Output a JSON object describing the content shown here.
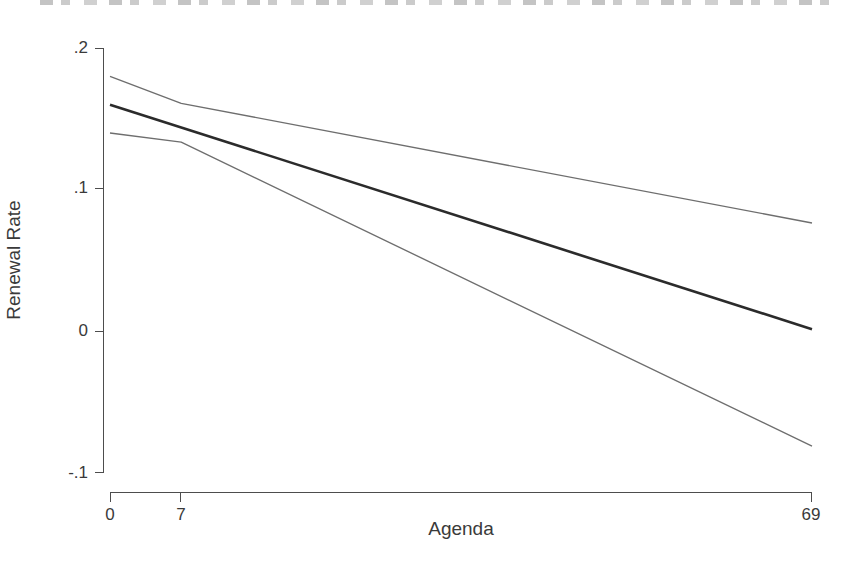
{
  "chart_data": {
    "type": "line",
    "title": "",
    "xlabel": "Agenda",
    "ylabel": "Renewal Rate",
    "xlim": [
      0,
      69
    ],
    "ylim": [
      -0.1,
      0.2
    ],
    "xticks": [
      0,
      7,
      69
    ],
    "xtick_labels": [
      "0",
      "7",
      "69"
    ],
    "yticks": [
      -0.1,
      0,
      0.1,
      0.2
    ],
    "ytick_labels": [
      "-.1",
      "0",
      ".1",
      ".2"
    ],
    "grid": false,
    "legend": "none",
    "series": [
      {
        "name": "upper-confidence-bound",
        "style": "thin",
        "x": [
          0,
          7,
          69
        ],
        "values": [
          0.18,
          0.161,
          0.0765
        ]
      },
      {
        "name": "fitted-renewal-rate",
        "style": "thick",
        "x": [
          0,
          69
        ],
        "values": [
          0.16,
          0.0015
        ]
      },
      {
        "name": "lower-confidence-bound",
        "style": "thin",
        "x": [
          0,
          7,
          69
        ],
        "values": [
          0.14,
          0.1335,
          -0.0811
        ]
      }
    ]
  },
  "axes": {
    "y_title": "Renewal Rate",
    "x_title": "Agenda",
    "y_tick_labels": [
      ".2",
      ".1",
      "0",
      "-.1"
    ],
    "x_tick_labels": [
      "0",
      "7",
      "69"
    ]
  },
  "colors": {
    "fit_line": "#2b2b2b",
    "ci_line": "#6e6e6e",
    "axis": "#4d4d4d",
    "text": "#3a3a3a",
    "background": "#ffffff"
  }
}
